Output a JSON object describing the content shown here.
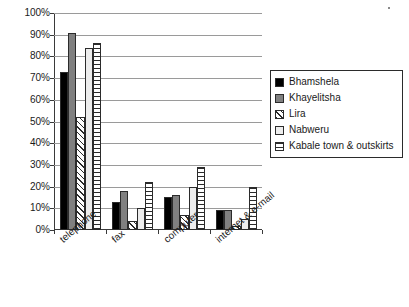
{
  "chart_data": {
    "type": "bar",
    "title": "",
    "subtitle": "",
    "xlabel": "",
    "ylabel": "",
    "categories": [
      "telephone",
      "fax",
      "computer",
      "internet & e-mail"
    ],
    "series": [
      {
        "name": "Bhamshela",
        "pattern": "solid-black",
        "values": [
          73,
          13,
          15,
          9
        ]
      },
      {
        "name": "Khayelitsha",
        "pattern": "solid-gray",
        "values": [
          91,
          18,
          16,
          9
        ]
      },
      {
        "name": "Lira",
        "pattern": "diagonal",
        "values": [
          52,
          4,
          7,
          2
        ]
      },
      {
        "name": "Nabweru",
        "pattern": "white",
        "values": [
          84,
          10,
          20,
          5
        ]
      },
      {
        "name": "Kabale town & outskirts",
        "pattern": "horizontal",
        "values": [
          86,
          22,
          29,
          20
        ]
      }
    ],
    "ylim": [
      0,
      100
    ],
    "ytick_labels": [
      "100%",
      "90%",
      "80%",
      "70%",
      "60%",
      "50%",
      "40%",
      "30%",
      "20%",
      "10%",
      "0%"
    ],
    "ytick_values": [
      100,
      90,
      80,
      70,
      60,
      50,
      40,
      30,
      20,
      10,
      0
    ],
    "grid": true,
    "legend_position": "right",
    "value_suffix": "%"
  },
  "legend": {
    "items": [
      {
        "label": "Bhamshela",
        "swatch": "solid-black-swatch"
      },
      {
        "label": "Khayelitsha",
        "swatch": "solid-gray-swatch"
      },
      {
        "label": "Lira",
        "swatch": "diagonal-hatch-swatch"
      },
      {
        "label": "Nabweru",
        "swatch": "white-swatch"
      },
      {
        "label": "Kabale town & outskirts",
        "swatch": "horizontal-stripe-swatch"
      }
    ]
  },
  "colors": {
    "series_black": "#000000",
    "series_gray": "#808080",
    "series_white": "#ededed",
    "axis": "#3a3a3a",
    "grid": "#9a9a9a",
    "text": "#1a1a1a",
    "background": "#ffffff"
  }
}
